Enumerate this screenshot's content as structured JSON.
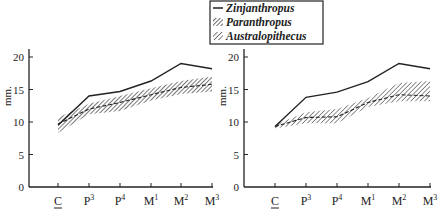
{
  "legend": {
    "items": [
      {
        "label": "Zinjanthropus",
        "style": "solid"
      },
      {
        "label": "Paranthropus",
        "style": "hatched-dense"
      },
      {
        "label": "Australopithecus",
        "style": "hatched-diagonal"
      }
    ]
  },
  "chart_data": [
    {
      "type": "line",
      "title": "",
      "xlabel": "",
      "ylabel": "mm.",
      "ylim": [
        0,
        20
      ],
      "yticks": [
        0,
        5,
        10,
        15,
        20
      ],
      "categories": [
        "C",
        "P3",
        "P4",
        "M1",
        "M2",
        "M3"
      ],
      "category_display": [
        {
          "base": "C",
          "sup": "",
          "underline": true
        },
        {
          "base": "P",
          "sup": "3",
          "underline": false
        },
        {
          "base": "P",
          "sup": "4",
          "underline": false
        },
        {
          "base": "M",
          "sup": "1",
          "underline": false
        },
        {
          "base": "M",
          "sup": "2",
          "underline": false
        },
        {
          "base": "M",
          "sup": "3",
          "underline": false
        }
      ],
      "grid": false,
      "series": [
        {
          "name": "Zinjanthropus",
          "style": "solid",
          "values": [
            9.5,
            14.0,
            14.7,
            16.3,
            19.0,
            18.2
          ]
        },
        {
          "name": "Paranthropus",
          "style": "dashed-mean-with-band",
          "values": [
            9.7,
            12.0,
            13.0,
            14.2,
            15.3,
            15.8
          ],
          "band_low": [
            8.3,
            11.2,
            11.7,
            13.3,
            14.3,
            14.7
          ],
          "band_high": [
            10.7,
            12.8,
            14.0,
            15.2,
            16.3,
            17.0
          ]
        }
      ]
    },
    {
      "type": "line",
      "title": "",
      "xlabel": "",
      "ylabel": "mm.",
      "ylim": [
        0,
        20
      ],
      "yticks": [
        0,
        5,
        10,
        15,
        20
      ],
      "categories": [
        "C",
        "P3",
        "P4",
        "M1",
        "M2",
        "M3"
      ],
      "category_display": [
        {
          "base": "C",
          "sup": "",
          "underline": true
        },
        {
          "base": "P",
          "sup": "3",
          "underline": false
        },
        {
          "base": "P",
          "sup": "4",
          "underline": false
        },
        {
          "base": "M",
          "sup": "1",
          "underline": false
        },
        {
          "base": "M",
          "sup": "2",
          "underline": false
        },
        {
          "base": "M",
          "sup": "3",
          "underline": false
        }
      ],
      "grid": false,
      "series": [
        {
          "name": "Zinjanthropus",
          "style": "solid",
          "values": [
            9.3,
            13.8,
            14.6,
            16.2,
            19.0,
            18.2
          ]
        },
        {
          "name": "Australopithecus",
          "style": "dashed-mean-with-band",
          "values": [
            9.3,
            10.7,
            10.8,
            13.0,
            14.2,
            14.0
          ],
          "band_low": [
            9.0,
            9.8,
            9.8,
            12.3,
            13.2,
            13.2
          ],
          "band_high": [
            9.6,
            11.5,
            12.0,
            13.7,
            16.0,
            16.3
          ]
        }
      ]
    }
  ]
}
